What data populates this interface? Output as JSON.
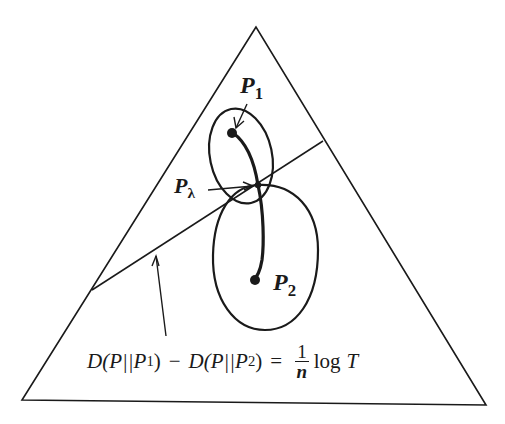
{
  "diagram": {
    "type": "probability-simplex",
    "shape": "triangle",
    "labels": {
      "p1": "P",
      "p1_sub": "1",
      "p2": "P",
      "p2_sub": "2",
      "plambda": "P",
      "plambda_sub": "λ"
    },
    "equation": {
      "left_a": "D(P||P",
      "left_a_sub": "1",
      "left_a_close": ")",
      "minus": "−",
      "left_b": "D(P||P",
      "left_b_sub": "2",
      "left_b_close": ")",
      "equals": "=",
      "frac_num": "1",
      "frac_den": "n",
      "log": "log",
      "T": "T"
    },
    "colors": {
      "stroke": "#1a1a1a",
      "background": "#ffffff"
    }
  }
}
